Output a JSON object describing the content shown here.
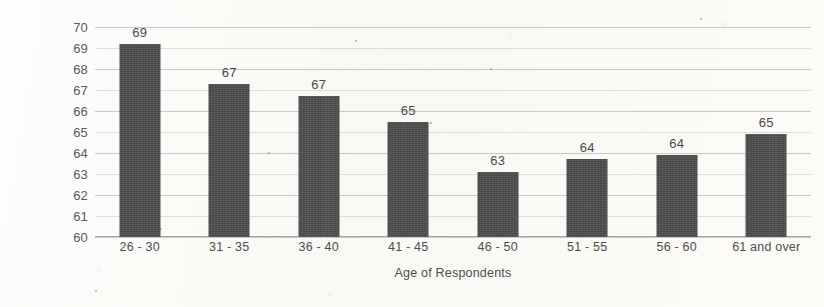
{
  "chart_data": {
    "type": "bar",
    "title": "",
    "xlabel": "Age of Respondents",
    "ylabel": "Trust with High Push and Pull",
    "categories": [
      "26 - 30",
      "31 - 35",
      "36 - 40",
      "41 - 45",
      "46 - 50",
      "51 - 55",
      "56 - 60",
      "61 and over"
    ],
    "values": [
      69.2,
      67.3,
      66.7,
      65.5,
      63.1,
      63.7,
      63.9,
      64.9
    ],
    "data_labels": [
      "69",
      "67",
      "67",
      "65",
      "63",
      "64",
      "64",
      "65"
    ],
    "ylim": [
      60,
      70
    ],
    "ytick_labels": [
      "70",
      "69",
      "68",
      "67",
      "66",
      "65",
      "64",
      "63",
      "62",
      "61",
      "60"
    ],
    "ytick_values": [
      70,
      69,
      68,
      67,
      66,
      65,
      64,
      63,
      62,
      61,
      60
    ],
    "ystep": 1,
    "grid": true,
    "legend": "none",
    "series_name": "Trust with High Push and Pull",
    "bar_color": "#484848",
    "gridline_color": "#c9c9c9",
    "background_color": "#fbfbf9",
    "text_color": "#4e4e4e"
  }
}
